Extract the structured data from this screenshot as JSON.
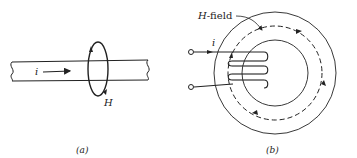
{
  "figure_a": {
    "current_label": "i",
    "field_label": "H",
    "caption": "(a)"
  },
  "figure_b": {
    "field_label_italic": "H",
    "field_label_suffix": "-field",
    "current_label": "i",
    "caption": "(b)"
  },
  "colors": {
    "stroke": "#222222",
    "background": "#ffffff"
  }
}
